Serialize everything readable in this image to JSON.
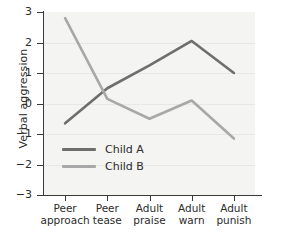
{
  "chart_data": {
    "type": "line",
    "title": "",
    "xlabel": "",
    "ylabel": "Verbal aggression",
    "categories": [
      "Peer approach",
      "Peer tease",
      "Adult praise",
      "Adult warn",
      "Adult punish"
    ],
    "category_lines": [
      [
        "Peer",
        "approach"
      ],
      [
        "Peer",
        "tease"
      ],
      [
        "Adult",
        "praise"
      ],
      [
        "Adult",
        "warn"
      ],
      [
        "Adult",
        "punish"
      ]
    ],
    "ylim": [
      -3,
      3
    ],
    "yticks": [
      3,
      2,
      1,
      0,
      -1,
      -2,
      -3
    ],
    "ytick_labels": [
      "3",
      "2",
      "1",
      "0",
      "−1",
      "−2",
      "−3"
    ],
    "grid": true,
    "legend_position": "inside-lower-left",
    "series": [
      {
        "name": "Child A",
        "color": "#6e6e6e",
        "values": [
          -0.65,
          0.5,
          1.25,
          2.05,
          1.0
        ]
      },
      {
        "name": "Child B",
        "color": "#a8a8a8",
        "values": [
          2.8,
          0.15,
          -0.5,
          0.1,
          -1.15
        ]
      }
    ]
  },
  "legend": {
    "items": [
      {
        "label": "Child A"
      },
      {
        "label": "Child B"
      }
    ]
  },
  "colors": {
    "series_a": "#6e6e6e",
    "series_b": "#a8a8a8",
    "axis": "#3a3a3a",
    "plot_background": "#f4f4f2",
    "gridline": "#e7e7e4",
    "text": "#2b2b2b"
  }
}
